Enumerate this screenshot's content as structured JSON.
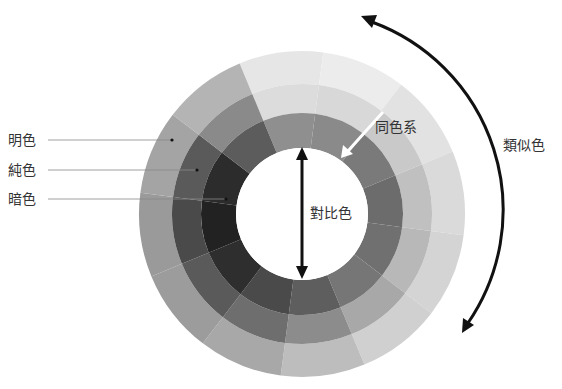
{
  "diagram": {
    "title": "",
    "wheel": {
      "center": [
        302,
        214
      ],
      "radii": {
        "outer": 163,
        "middle": 130,
        "inner": 101,
        "hole": 66
      },
      "segments": 12,
      "start_angle_deg": -112.5,
      "rings": {
        "outer_light": [
          "#e6e6e6",
          "#ececec",
          "#e2e2e2",
          "#dadada",
          "#d4d4d4",
          "#d0d0d0",
          "#bdbdbd",
          "#a8a8a8",
          "#9c9c9c",
          "#9a9a9a",
          "#a4a4a4",
          "#b4b4b4"
        ],
        "middle_pure": [
          "#dcdcdc",
          "#d8d8d8",
          "#c9c9c9",
          "#c0c0c0",
          "#b8b8b8",
          "#a8a8a8",
          "#8c8c8c",
          "#6e6e6e",
          "#5a5a5a",
          "#4a4a4a",
          "#5a5a5a",
          "#8a8a8a"
        ],
        "inner_dark": [
          "#8f8f8f",
          "#8a8a8a",
          "#7a7a7a",
          "#6c6c6c",
          "#707070",
          "#767676",
          "#5e5e5e",
          "#4a4a4a",
          "#2e2e2e",
          "#222222",
          "#2c2c2c",
          "#5c5c5c"
        ]
      }
    },
    "labels": {
      "light": "明色",
      "pure": "純色",
      "dark": "暗色",
      "same_hue": "同色系",
      "analogous": "類似色",
      "complementary": "對比色"
    },
    "colors": {
      "arrow": "#111111",
      "white_arrow": "#ffffff",
      "leader_line": "#888888",
      "text": "#333333"
    }
  }
}
